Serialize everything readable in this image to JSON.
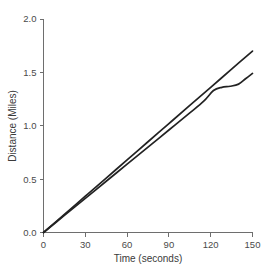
{
  "chart_data": {
    "type": "line",
    "title": "",
    "xlabel": "Time (seconds)",
    "ylabel": "Distance (Miles)",
    "xlim": [
      0,
      150
    ],
    "ylim": [
      0.0,
      2.0
    ],
    "xticks": [
      0,
      30,
      60,
      90,
      120,
      150
    ],
    "yticks": [
      "0.0",
      "0.5",
      "1.0",
      "1.5",
      "2.0"
    ],
    "ytick_values": [
      0.0,
      0.5,
      1.0,
      1.5,
      2.0
    ],
    "grid": false,
    "legend": false,
    "legend_position": "none",
    "line_color": "#222222",
    "axis_color": "#6e6e6e",
    "background": "#ffffff",
    "series": [
      {
        "name": "upper-line",
        "x": [
          0,
          15,
          30,
          45,
          60,
          75,
          90,
          105,
          120,
          135,
          150
        ],
        "values": [
          0.0,
          0.17,
          0.34,
          0.51,
          0.68,
          0.85,
          1.02,
          1.19,
          1.36,
          1.53,
          1.7
        ]
      },
      {
        "name": "lower-curve",
        "x": [
          0,
          15,
          30,
          45,
          60,
          75,
          90,
          105,
          115,
          122,
          128,
          134,
          140,
          145,
          150
        ],
        "values": [
          0.0,
          0.16,
          0.32,
          0.48,
          0.64,
          0.8,
          0.96,
          1.12,
          1.23,
          1.33,
          1.36,
          1.37,
          1.39,
          1.44,
          1.49
        ]
      }
    ]
  },
  "axis": {
    "x_label": "Time (seconds)",
    "y_label": "Distance (Miles)"
  },
  "footer": {
    "clipped_text": ""
  }
}
